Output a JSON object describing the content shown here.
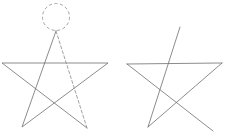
{
  "figure": {
    "title": "Two pentagram figures",
    "background_color": "#ffffff",
    "stroke_color": "#6e6e6e",
    "dashed_color": "#9a9a9a",
    "canvas": {
      "width": 225,
      "height": 137
    },
    "panels": [
      {
        "id": "left-star",
        "name": "complete-star-with-circle",
        "description": "Completed five-pointed star drawn in one stroke, with a dashed circle marking the apex and the final dashed edge returning to the apex.",
        "vertices": {
          "apex": [
            56,
            31
          ],
          "upper_left": [
            2,
            63
          ],
          "upper_right": [
            108,
            63
          ],
          "lower_left": [
            22,
            127
          ],
          "lower_right": [
            87,
            128
          ]
        },
        "circle": {
          "cx": 56,
          "cy": 17,
          "r": 13.5,
          "style": "dashed"
        },
        "edges": [
          {
            "from": "apex",
            "to": "lower_right",
            "style": "dashed"
          },
          {
            "from": "lower_right",
            "to": "upper_left",
            "style": "solid"
          },
          {
            "from": "upper_left",
            "to": "upper_right",
            "style": "solid"
          },
          {
            "from": "upper_right",
            "to": "lower_left",
            "style": "solid"
          },
          {
            "from": "lower_left",
            "to": "apex",
            "style": "solid"
          }
        ]
      },
      {
        "id": "right-star",
        "name": "incomplete-star",
        "description": "Partially drawn five-pointed star; the closing edge back to the apex is missing and the apex stroke overshoots upward to the right.",
        "vertices": {
          "apex_overshoot": [
            180,
            27
          ],
          "upper_left": [
            127,
            64
          ],
          "upper_right": [
            222,
            63
          ],
          "lower_left": [
            148,
            127
          ],
          "lower_right": [
            213,
            131
          ]
        },
        "edges": [
          {
            "from": "lower_left",
            "to": "apex_overshoot",
            "style": "solid"
          },
          {
            "from": "upper_left",
            "to": "upper_right",
            "style": "solid"
          },
          {
            "from": "upper_left",
            "to": "lower_right",
            "style": "solid"
          },
          {
            "from": "upper_right",
            "to": "lower_left",
            "style": "solid"
          }
        ]
      }
    ]
  }
}
